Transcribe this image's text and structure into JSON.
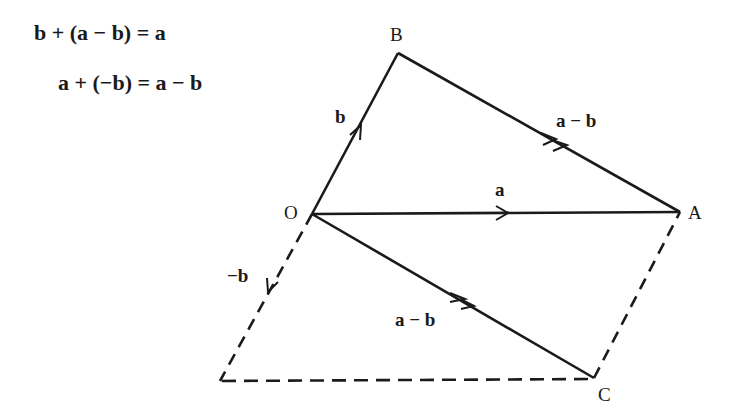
{
  "equations": [
    "b + (a − b) = a",
    "a + (−b) = a − b"
  ],
  "points": {
    "O": {
      "label": "O",
      "x": 312,
      "y": 214
    },
    "B": {
      "label": "B",
      "x": 398,
      "y": 53
    },
    "A": {
      "label": "A",
      "x": 680,
      "y": 212
    },
    "C": {
      "label": "C",
      "x": 594,
      "y": 378
    },
    "D": {
      "label": "",
      "x": 220,
      "y": 381
    }
  },
  "vectors": {
    "b": "b",
    "a_minus_b_top": "a − b",
    "a": "a",
    "neg_b": "−b",
    "a_minus_b_bottom": "a − b"
  },
  "colors": {
    "stroke": "#1a1a1a",
    "background": "#ffffff"
  }
}
